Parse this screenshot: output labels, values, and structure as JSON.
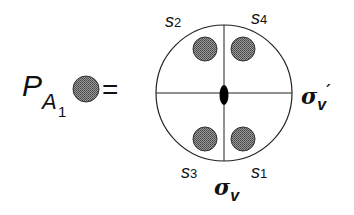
{
  "lhs": {
    "symbol": "P",
    "subscript_main": "A",
    "subscript_index": "1",
    "equals": "="
  },
  "diagram": {
    "corner_labels": [
      {
        "id": "s2",
        "letter": "s",
        "index": "2",
        "position": "top-left"
      },
      {
        "id": "s4",
        "letter": "s",
        "index": "4",
        "position": "top-right"
      },
      {
        "id": "s3",
        "letter": "s",
        "index": "3",
        "position": "bottom-left"
      },
      {
        "id": "s1",
        "letter": "s",
        "index": "1",
        "position": "bottom-right"
      }
    ],
    "sigma_v": {
      "symbol": "σ",
      "sub": "v"
    },
    "sigma_v_prime": {
      "symbol": "σ",
      "sub": "v",
      "prime": "′"
    },
    "colors": {
      "orbital_fill": "#7a7a7a",
      "line": "#222222",
      "center_fill": "#000000"
    }
  }
}
